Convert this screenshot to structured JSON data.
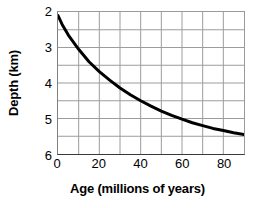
{
  "chart_data": {
    "type": "line",
    "title": "",
    "xlabel": "Age (millions of years)",
    "ylabel": "Depth (km)",
    "xlim": [
      0,
      90
    ],
    "ylim": [
      2,
      6
    ],
    "y_inverted": true,
    "grid": true,
    "legend": "none",
    "xticks": [
      {
        "value": 0,
        "label": "0"
      },
      {
        "value": 20,
        "label": "20"
      },
      {
        "value": 40,
        "label": "40"
      },
      {
        "value": 60,
        "label": "60"
      },
      {
        "value": 80,
        "label": "80"
      }
    ],
    "yticks": [
      {
        "value": 2,
        "label": "2"
      },
      {
        "value": 3,
        "label": "3"
      },
      {
        "value": 4,
        "label": "4"
      },
      {
        "value": 5,
        "label": "5"
      },
      {
        "value": 6,
        "label": "6"
      }
    ],
    "x_gridlines": [
      0,
      10,
      20,
      30,
      40,
      50,
      60,
      70,
      80,
      90
    ],
    "y_gridlines": [
      2,
      2.5,
      3,
      3.5,
      4,
      4.5,
      5,
      5.5,
      6
    ],
    "series": [
      {
        "name": "Ocean depth vs seafloor age",
        "color": "#000000",
        "line_width": 3,
        "x": [
          0,
          2,
          5,
          10,
          15,
          20,
          25,
          30,
          35,
          40,
          45,
          50,
          55,
          60,
          65,
          70,
          75,
          80,
          85,
          90
        ],
        "values": [
          2.1,
          2.35,
          2.65,
          3.05,
          3.4,
          3.68,
          3.92,
          4.14,
          4.33,
          4.5,
          4.65,
          4.79,
          4.91,
          5.02,
          5.12,
          5.2,
          5.28,
          5.34,
          5.4,
          5.45
        ]
      }
    ]
  },
  "axes": {
    "frame_color": "#8a8a8a",
    "grid_color": "#9a9a9a",
    "tick_label_color": "#1a1a1a"
  }
}
